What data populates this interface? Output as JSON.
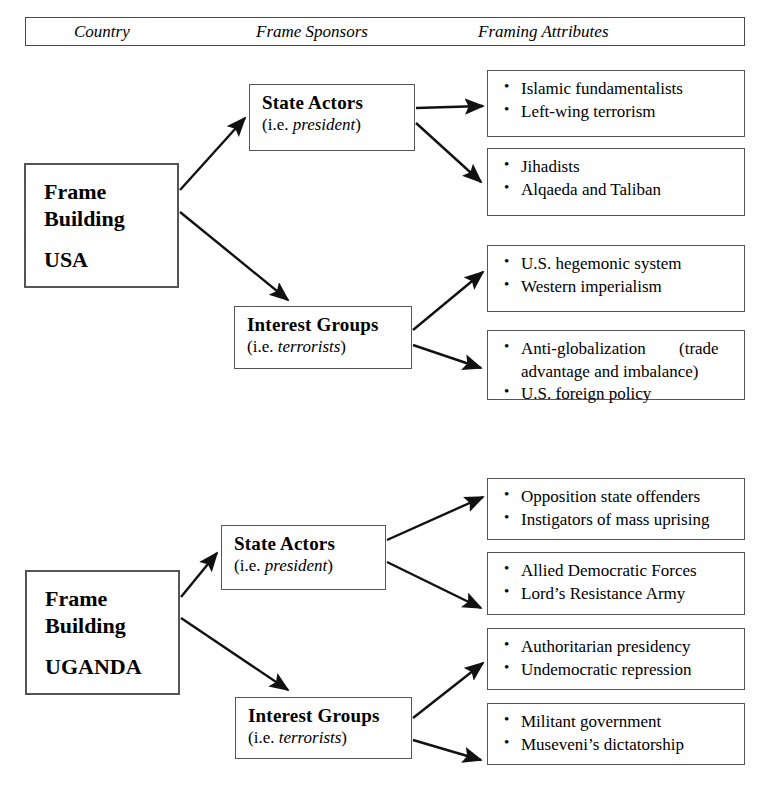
{
  "legend": {
    "country": "Country",
    "sponsors": "Frame Sponsors",
    "attributes": "Framing Attributes"
  },
  "sections": [
    {
      "id": "usa",
      "country": {
        "line1": "Frame",
        "line2": "Building",
        "name": "USA"
      },
      "sponsors": [
        {
          "id": "usa-state-actors",
          "title": "State Actors",
          "sub_prefix": "(i.e. ",
          "sub_italic": "president",
          "sub_suffix": ")"
        },
        {
          "id": "usa-interest-groups",
          "title": "Interest  Groups",
          "sub_prefix": "(i.e. ",
          "sub_italic": "terrorists",
          "sub_suffix": ")"
        }
      ],
      "attributes": [
        {
          "id": "usa-attr-1",
          "from": "usa-state-actors",
          "items": [
            "Islamic fundamentalists",
            "Left-wing terrorism"
          ]
        },
        {
          "id": "usa-attr-2",
          "from": "usa-state-actors",
          "items": [
            "Jihadists",
            "Alqaeda and Taliban"
          ]
        },
        {
          "id": "usa-attr-3",
          "from": "usa-interest-groups",
          "items": [
            "U.S. hegemonic system",
            "Western imperialism"
          ]
        },
        {
          "id": "usa-attr-4",
          "from": "usa-interest-groups",
          "items": [
            "Anti-globalization (trade advantage and imbalance)",
            "U.S. foreign policy"
          ],
          "item0_segments": [
            "Anti-globalization",
            "(trade advantage and imbalance)"
          ]
        }
      ]
    },
    {
      "id": "uganda",
      "country": {
        "line1": "Frame",
        "line2": "Building",
        "name": "UGANDA"
      },
      "sponsors": [
        {
          "id": "uganda-state-actors",
          "title": "State Actors",
          "sub_prefix": "(i.e. ",
          "sub_italic": "president",
          "sub_suffix": ")"
        },
        {
          "id": "uganda-interest-groups",
          "title": "Interest  Groups",
          "sub_prefix": "(i.e. ",
          "sub_italic": "terrorists",
          "sub_suffix": ")"
        }
      ],
      "attributes": [
        {
          "id": "uganda-attr-1",
          "from": "uganda-state-actors",
          "items": [
            "Opposition state offenders",
            "Instigators of mass uprising"
          ]
        },
        {
          "id": "uganda-attr-2",
          "from": "uganda-state-actors",
          "items": [
            "Allied Democratic Forces",
            "Lord’s Resistance Army"
          ]
        },
        {
          "id": "uganda-attr-3",
          "from": "uganda-interest-groups",
          "items": [
            "Authoritarian presidency",
            "Undemocratic repression"
          ]
        },
        {
          "id": "uganda-attr-4",
          "from": "uganda-interest-groups",
          "items": [
            "Militant government",
            "Museveni’s dictatorship"
          ]
        }
      ]
    }
  ],
  "colors": {
    "background": "#ffffff",
    "border": "#555555",
    "text": "#000000",
    "arrow": "#111111"
  }
}
